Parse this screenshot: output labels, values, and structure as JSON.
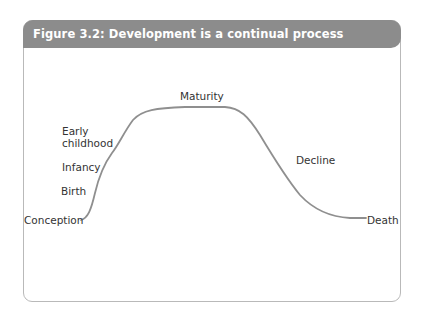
{
  "figure": {
    "title": "Figure 3.2: Development is a continual process",
    "header_color": "#8c8c8c",
    "curve_color": "#8f8f8f"
  },
  "labels": {
    "conception": "Conception",
    "birth": "Birth",
    "infancy": "Infancy",
    "early_childhood_1": "Early",
    "early_childhood_2": "childhood",
    "maturity": "Maturity",
    "decline": "Decline",
    "death": "Death"
  },
  "stages": [
    "Conception",
    "Birth",
    "Infancy",
    "Early childhood",
    "Maturity",
    "Decline",
    "Death"
  ]
}
